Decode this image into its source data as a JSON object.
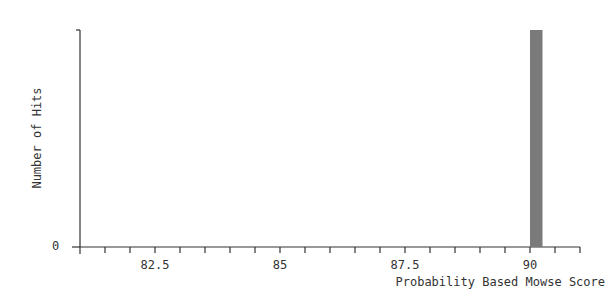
{
  "chart_data": {
    "type": "bar",
    "title": "",
    "xlabel": "Probability Based Mowse Score",
    "ylabel": "Number of Hits",
    "xlim": [
      81.0,
      91.0
    ],
    "ylim": [
      0,
      1
    ],
    "x_tick_labels": [
      "82.5",
      "85",
      "87.5",
      "90"
    ],
    "x_tick_values": [
      82.5,
      85,
      87.5,
      90
    ],
    "x_minor_tick_step": 0.5,
    "y_tick_labels": [
      "0"
    ],
    "grid": false,
    "legend": null,
    "bars": [
      {
        "x_start": 90.0,
        "x_end": 90.25,
        "value": 1,
        "color": "#7a7a7a"
      }
    ]
  },
  "axes": {
    "ylabel": "Number of Hits",
    "xlabel": "Probability Based Mowse Score",
    "zero_label": "0",
    "x_ticks": [
      "82.5",
      "85",
      "87.5",
      "90"
    ]
  },
  "colors": {
    "axis": "#333333",
    "bar": "#7a7a7a"
  }
}
